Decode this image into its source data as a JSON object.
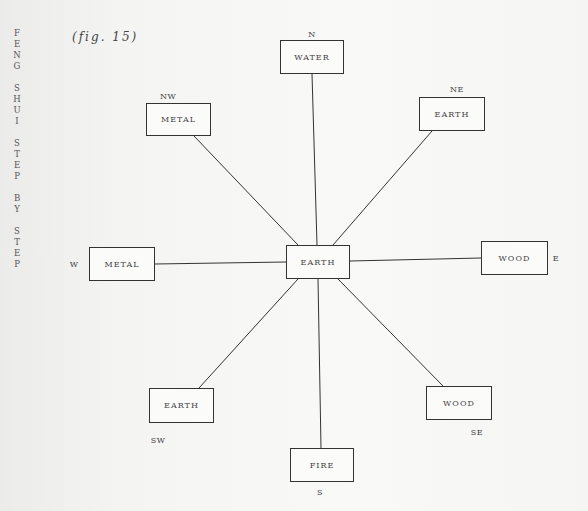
{
  "spine_title": {
    "words": [
      [
        "F",
        "E",
        "N",
        "G"
      ],
      [
        "S",
        "H",
        "U",
        "I"
      ],
      [
        "S",
        "T",
        "E",
        "P"
      ],
      [
        "B",
        "Y"
      ],
      [
        "S",
        "T",
        "E",
        "P"
      ]
    ]
  },
  "figure_label": "(fig. 15)",
  "diagram": {
    "center": {
      "element": "EARTH",
      "x": 286,
      "y": 245,
      "w": 64,
      "h": 34
    },
    "nodes": [
      {
        "id": "n",
        "direction": "N",
        "element": "WATER",
        "x": 280,
        "y": 40,
        "w": 64,
        "h": 34,
        "label_x": 312,
        "label_y": 34
      },
      {
        "id": "ne",
        "direction": "NE",
        "element": "EARTH",
        "x": 419,
        "y": 97,
        "w": 66,
        "h": 34,
        "label_x": 457,
        "label_y": 89
      },
      {
        "id": "e",
        "direction": "E",
        "element": "WOOD",
        "x": 481,
        "y": 241,
        "w": 67,
        "h": 34,
        "label_x": 556,
        "label_y": 258
      },
      {
        "id": "se",
        "direction": "SE",
        "element": "WOOD",
        "x": 426,
        "y": 386,
        "w": 66,
        "h": 34,
        "label_x": 477,
        "label_y": 432
      },
      {
        "id": "s",
        "direction": "S",
        "element": "FIRE",
        "x": 290,
        "y": 448,
        "w": 64,
        "h": 34,
        "label_x": 320,
        "label_y": 492
      },
      {
        "id": "sw",
        "direction": "SW",
        "element": "EARTH",
        "x": 149,
        "y": 388,
        "w": 65,
        "h": 35,
        "label_x": 158,
        "label_y": 440
      },
      {
        "id": "w",
        "direction": "W",
        "element": "METAL",
        "x": 89,
        "y": 247,
        "w": 66,
        "h": 34,
        "label_x": 74,
        "label_y": 264
      },
      {
        "id": "nw",
        "direction": "NW",
        "element": "METAL",
        "x": 146,
        "y": 103,
        "w": 65,
        "h": 33,
        "label_x": 168,
        "label_y": 96
      }
    ],
    "connectors": [
      {
        "to": "n",
        "x1": 317,
        "y1": 245,
        "x2": 312,
        "y2": 74
      },
      {
        "to": "ne",
        "x1": 333,
        "y1": 245,
        "x2": 432,
        "y2": 131
      },
      {
        "to": "e",
        "x1": 350,
        "y1": 261,
        "x2": 481,
        "y2": 258
      },
      {
        "to": "se",
        "x1": 338,
        "y1": 279,
        "x2": 443,
        "y2": 386
      },
      {
        "to": "s",
        "x1": 318,
        "y1": 279,
        "x2": 321,
        "y2": 448
      },
      {
        "to": "sw",
        "x1": 298,
        "y1": 279,
        "x2": 199,
        "y2": 388
      },
      {
        "to": "w",
        "x1": 286,
        "y1": 262,
        "x2": 155,
        "y2": 264
      },
      {
        "to": "nw",
        "x1": 298,
        "y1": 245,
        "x2": 194,
        "y2": 136
      }
    ],
    "colors": {
      "line": "#333333",
      "text": "#444444"
    }
  }
}
